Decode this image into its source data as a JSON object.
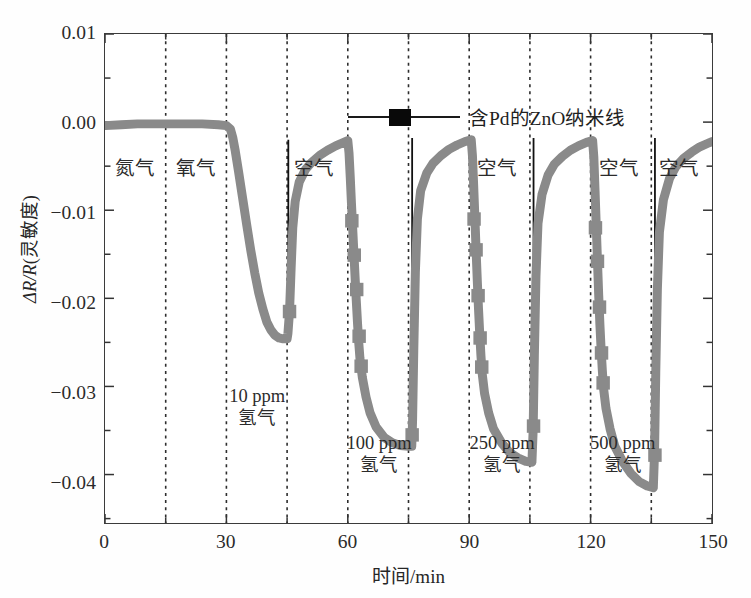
{
  "figure": {
    "background": "#ffffff",
    "frame_color": "#3b3b3b"
  },
  "legend": {
    "label": "含Pd的ZnO纳米线",
    "marker": "filled-square",
    "marker_color": "#090909",
    "line_color": "#1a1a1a",
    "position": "top-center"
  },
  "axes": {
    "xlabel": "时间/min",
    "ylabel_prefix": "ΔR/R",
    "ylabel_suffix": "(灵敏度)",
    "xticks": [
      "0",
      "30",
      "60",
      "90",
      "120",
      "150"
    ],
    "yticks": [
      "0.01",
      "0.00",
      "−0.01",
      "−0.02",
      "−0.03",
      "−0.04"
    ]
  },
  "annotations": {
    "gas_labels": [
      {
        "text": "氮气",
        "x": 7.5,
        "y": -0.0055
      },
      {
        "text": "氧气",
        "x": 22.5,
        "y": -0.0055
      },
      {
        "text": "空气",
        "x": 51.5,
        "y": -0.0055
      },
      {
        "text": "空气",
        "x": 96.5,
        "y": -0.0055
      },
      {
        "text": "空气",
        "x": 126.5,
        "y": -0.0055
      },
      {
        "text": "空气",
        "x": 141.5,
        "y": -0.0055
      }
    ],
    "concentration_labels": [
      {
        "line1": "10 ppm",
        "line2": "氢气",
        "x": 37.5,
        "y": -0.0313
      },
      {
        "line1": "100 ppm",
        "line2": "氢气",
        "x": 67.5,
        "y": -0.0366
      },
      {
        "line1": "250 ppm",
        "line2": "氢气",
        "x": 97.8,
        "y": -0.0366
      },
      {
        "line1": "500 ppm",
        "line2": "氢气",
        "x": 127.5,
        "y": -0.0366
      }
    ]
  },
  "chart_data": {
    "type": "line",
    "title": "",
    "xlabel": "时间/min",
    "ylabel": "ΔR/R(灵敏度)",
    "xlim": [
      0,
      150
    ],
    "ylim": [
      -0.0455,
      0.01
    ],
    "xticks": [
      0,
      30,
      60,
      90,
      120,
      150
    ],
    "yticks": [
      0.01,
      0.0,
      -0.01,
      -0.02,
      -0.03,
      -0.04
    ],
    "grid": "vertical-dashed-every-15min",
    "gridlines_x": [
      15,
      30,
      45,
      60,
      75,
      90,
      105,
      120,
      135
    ],
    "line_color": "#8a8a8a",
    "line_width": 9,
    "marker": "square",
    "marker_color": "#8a8a8a",
    "series": [
      {
        "name": "含Pd的ZnO纳米线",
        "points": [
          [
            0.0,
            -0.0004
          ],
          [
            4.0,
            -0.0003
          ],
          [
            8.0,
            -0.0002
          ],
          [
            12.0,
            -0.0002
          ],
          [
            16.0,
            -0.0002
          ],
          [
            20.0,
            -0.0002
          ],
          [
            24.0,
            -0.0002
          ],
          [
            28.0,
            -0.0003
          ],
          [
            30.0,
            -0.0004
          ],
          [
            31.0,
            -0.0008
          ],
          [
            31.6,
            -0.0018
          ],
          [
            32.2,
            -0.0033
          ],
          [
            33.0,
            -0.0056
          ],
          [
            34.0,
            -0.0086
          ],
          [
            35.0,
            -0.0116
          ],
          [
            36.0,
            -0.0145
          ],
          [
            37.0,
            -0.0171
          ],
          [
            38.0,
            -0.0194
          ],
          [
            39.0,
            -0.0212
          ],
          [
            40.0,
            -0.0227
          ],
          [
            41.0,
            -0.0236
          ],
          [
            42.0,
            -0.0242
          ],
          [
            43.0,
            -0.0245
          ],
          [
            44.0,
            -0.0246
          ],
          [
            45.0,
            -0.0246
          ],
          [
            45.2,
            -0.024
          ],
          [
            45.6,
            -0.0215
          ],
          [
            46.0,
            -0.0165
          ],
          [
            46.4,
            -0.012
          ],
          [
            47.0,
            -0.009
          ],
          [
            48.0,
            -0.0068
          ],
          [
            49.5,
            -0.0054
          ],
          [
            51.0,
            -0.0046
          ],
          [
            53.0,
            -0.0038
          ],
          [
            55.0,
            -0.0032
          ],
          [
            57.0,
            -0.0027
          ],
          [
            59.0,
            -0.0023
          ],
          [
            60.0,
            -0.0021
          ],
          [
            60.3,
            -0.0035
          ],
          [
            60.6,
            -0.0062
          ],
          [
            60.9,
            -0.0092
          ],
          [
            61.2,
            -0.012
          ],
          [
            61.5,
            -0.0148
          ],
          [
            61.8,
            -0.0176
          ],
          [
            62.1,
            -0.0203
          ],
          [
            62.4,
            -0.0228
          ],
          [
            62.7,
            -0.025
          ],
          [
            63.0,
            -0.0268
          ],
          [
            63.6,
            -0.029
          ],
          [
            64.5,
            -0.0312
          ],
          [
            65.5,
            -0.033
          ],
          [
            67.0,
            -0.0346
          ],
          [
            69.0,
            -0.0358
          ],
          [
            71.0,
            -0.0364
          ],
          [
            73.0,
            -0.0367
          ],
          [
            75.0,
            -0.0368
          ],
          [
            75.8,
            -0.0368
          ],
          [
            76.0,
            -0.034
          ],
          [
            76.3,
            -0.026
          ],
          [
            76.7,
            -0.017
          ],
          [
            77.2,
            -0.011
          ],
          [
            78.0,
            -0.0078
          ],
          [
            79.5,
            -0.0058
          ],
          [
            81.0,
            -0.0047
          ],
          [
            83.0,
            -0.0038
          ],
          [
            85.0,
            -0.0031
          ],
          [
            87.0,
            -0.0026
          ],
          [
            89.0,
            -0.0022
          ],
          [
            90.5,
            -0.002
          ],
          [
            90.8,
            -0.0038
          ],
          [
            91.1,
            -0.0072
          ],
          [
            91.4,
            -0.0108
          ],
          [
            91.7,
            -0.0145
          ],
          [
            92.0,
            -0.018
          ],
          [
            92.3,
            -0.0212
          ],
          [
            92.6,
            -0.024
          ],
          [
            92.9,
            -0.0265
          ],
          [
            93.2,
            -0.0285
          ],
          [
            93.8,
            -0.0308
          ],
          [
            94.8,
            -0.033
          ],
          [
            96.0,
            -0.0348
          ],
          [
            98.0,
            -0.0364
          ],
          [
            100.0,
            -0.0375
          ],
          [
            102.0,
            -0.0381
          ],
          [
            104.0,
            -0.0385
          ],
          [
            105.5,
            -0.0386
          ],
          [
            105.8,
            -0.035
          ],
          [
            106.1,
            -0.0265
          ],
          [
            106.5,
            -0.0175
          ],
          [
            107.0,
            -0.0115
          ],
          [
            108.0,
            -0.0082
          ],
          [
            109.5,
            -0.006
          ],
          [
            111.0,
            -0.0048
          ],
          [
            113.0,
            -0.0039
          ],
          [
            115.0,
            -0.0032
          ],
          [
            117.0,
            -0.0027
          ],
          [
            119.0,
            -0.0023
          ],
          [
            120.5,
            -0.0021
          ],
          [
            120.8,
            -0.004
          ],
          [
            121.1,
            -0.0078
          ],
          [
            121.4,
            -0.0118
          ],
          [
            121.7,
            -0.0158
          ],
          [
            122.0,
            -0.0196
          ],
          [
            122.3,
            -0.023
          ],
          [
            122.6,
            -0.0258
          ],
          [
            122.9,
            -0.0282
          ],
          [
            123.2,
            -0.0302
          ],
          [
            123.8,
            -0.0325
          ],
          [
            124.8,
            -0.0348
          ],
          [
            126.0,
            -0.0368
          ],
          [
            128.0,
            -0.0386
          ],
          [
            130.0,
            -0.0399
          ],
          [
            132.0,
            -0.0408
          ],
          [
            134.0,
            -0.0413
          ],
          [
            135.5,
            -0.0415
          ],
          [
            135.8,
            -0.0375
          ],
          [
            136.1,
            -0.0285
          ],
          [
            136.5,
            -0.019
          ],
          [
            137.0,
            -0.0125
          ],
          [
            138.0,
            -0.0088
          ],
          [
            139.5,
            -0.0064
          ],
          [
            141.0,
            -0.0051
          ],
          [
            143.0,
            -0.0041
          ],
          [
            145.0,
            -0.0034
          ],
          [
            147.0,
            -0.0028
          ],
          [
            149.0,
            -0.0024
          ],
          [
            150.0,
            -0.0022
          ]
        ],
        "markers": [
          [
            61.0,
            -0.0112
          ],
          [
            61.6,
            -0.0151
          ],
          [
            62.2,
            -0.019
          ],
          [
            62.8,
            -0.0243
          ],
          [
            63.3,
            -0.0277
          ],
          [
            91.2,
            -0.011
          ],
          [
            91.7,
            -0.0145
          ],
          [
            92.2,
            -0.0197
          ],
          [
            92.7,
            -0.0245
          ],
          [
            93.1,
            -0.0278
          ],
          [
            121.2,
            -0.012
          ],
          [
            121.7,
            -0.0158
          ],
          [
            122.2,
            -0.021
          ],
          [
            122.7,
            -0.0262
          ],
          [
            123.1,
            -0.0296
          ],
          [
            45.6,
            -0.0215
          ],
          [
            75.9,
            -0.0355
          ],
          [
            105.9,
            -0.0345
          ],
          [
            135.9,
            -0.0378
          ]
        ]
      }
    ]
  }
}
